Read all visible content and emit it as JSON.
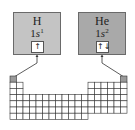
{
  "colors": {
    "h_box": "#c4c4c4",
    "he_box": "#a9a9a9",
    "grid_line": "#333333",
    "highlight_cell": "#9a9a9a"
  },
  "elements": [
    {
      "symbol": "H",
      "config_prefix": "1",
      "config_orbital": "s",
      "config_electrons": "1",
      "orbital_diagram": "↑"
    },
    {
      "symbol": "He",
      "config_prefix": "1",
      "config_orbital": "s",
      "config_electrons": "2",
      "orbital_diagram": "↑↓"
    }
  ],
  "periodic_table": {
    "columns": 18,
    "rows": 7,
    "highlighted_cells": [
      "H",
      "He"
    ]
  }
}
